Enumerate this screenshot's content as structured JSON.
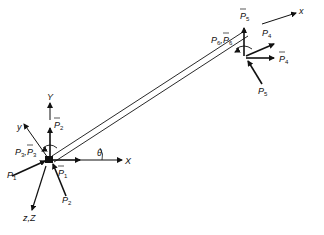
{
  "diagram": {
    "type": "beam-element-degrees-of-freedom",
    "colors": {
      "ink": "#111111",
      "background": "#ffffff"
    },
    "global_axes": {
      "X": "X",
      "Y": "Y",
      "Z": "z,Z"
    },
    "local_axes": {
      "x": "x",
      "y": "y"
    },
    "angle_label": "θ",
    "node_1": {
      "labels": {
        "p1_bar": {
          "base": "P",
          "sub": "1",
          "bar": true
        },
        "p2_bar": {
          "base": "P",
          "sub": "2",
          "bar": true
        },
        "p1": {
          "base": "P",
          "sub": "1",
          "bar": false
        },
        "p2": {
          "base": "P",
          "sub": "2",
          "bar": false
        },
        "p3": {
          "base": "P",
          "sub": "3",
          "bar": false
        },
        "p3_bar": {
          "base": "P",
          "sub": "3",
          "bar": true
        }
      }
    },
    "node_2": {
      "labels": {
        "p4": {
          "base": "P",
          "sub": "4",
          "bar": false
        },
        "p4_bar": {
          "base": "P",
          "sub": "4",
          "bar": true
        },
        "p5": {
          "base": "P",
          "sub": "5",
          "bar": false
        },
        "p5_bar": {
          "base": "P",
          "sub": "5",
          "bar": true
        },
        "p6": {
          "base": "P",
          "sub": "6",
          "bar": false
        },
        "p6_bar": {
          "base": "P",
          "sub": "6",
          "bar": true
        }
      }
    },
    "text": {
      "P": "P",
      "s1": "1",
      "s2": "2",
      "s3": "3",
      "s4": "4",
      "s5": "5",
      "s6": "6",
      "comma": ","
    }
  }
}
